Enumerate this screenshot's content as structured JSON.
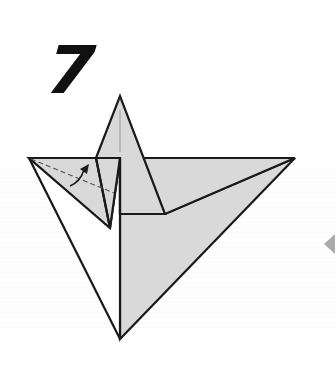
{
  "diagram": {
    "step_number": "7",
    "colors": {
      "paper_colored_side": "#d9d9d9",
      "paper_white_side": "#ffffff",
      "outline": "#1a1a1a",
      "fold_line": "#555555",
      "step_number": "#111111"
    },
    "elements": {
      "model": "origami-model-step-7",
      "fold_line_type": "valley-fold (dashed)",
      "arrow": "fold-direction-arrow",
      "next_step_hint": "partial next-step figure at right edge"
    }
  }
}
